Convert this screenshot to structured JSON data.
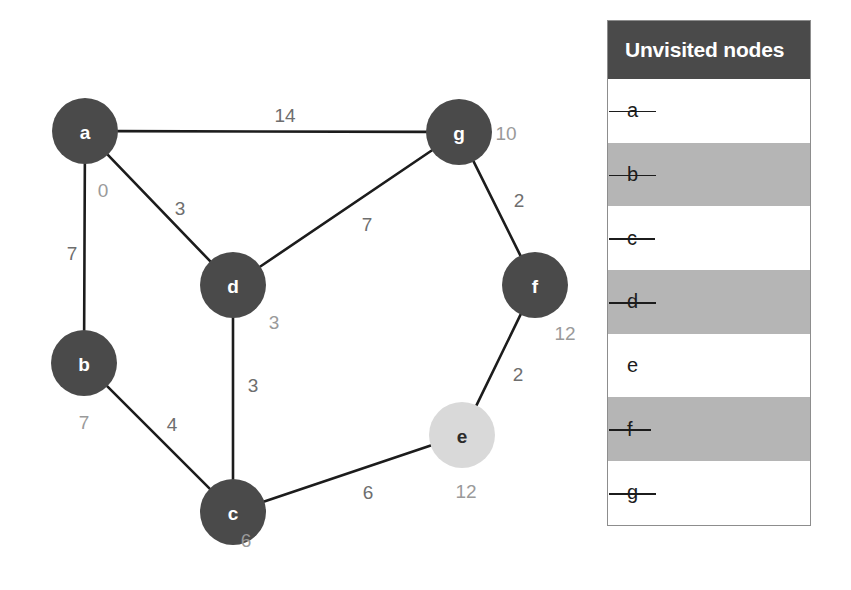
{
  "graph": {
    "nodes": [
      {
        "id": "a",
        "label": "a",
        "dist": "0",
        "cx": 85,
        "cy": 131,
        "r": 33,
        "state": "visited",
        "dist_x": 103,
        "dist_y": 190
      },
      {
        "id": "b",
        "label": "b",
        "dist": "7",
        "cx": 84,
        "cy": 363,
        "r": 33,
        "state": "visited",
        "dist_x": 84,
        "dist_y": 422
      },
      {
        "id": "c",
        "label": "c",
        "dist": "6",
        "cx": 233,
        "cy": 512,
        "r": 33,
        "state": "visited",
        "dist_x": 246,
        "dist_y": 540
      },
      {
        "id": "d",
        "label": "d",
        "dist": "3",
        "cx": 233,
        "cy": 285,
        "r": 33,
        "state": "visited",
        "dist_x": 274,
        "dist_y": 322
      },
      {
        "id": "e",
        "label": "e",
        "dist": "12",
        "cx": 462,
        "cy": 435,
        "r": 33,
        "state": "current",
        "dist_x": 466,
        "dist_y": 491
      },
      {
        "id": "f",
        "label": "f",
        "dist": "12",
        "cx": 535,
        "cy": 285,
        "r": 33,
        "state": "visited",
        "dist_x": 565,
        "dist_y": 333
      },
      {
        "id": "g",
        "label": "g",
        "dist": "10",
        "cx": 459,
        "cy": 132,
        "r": 33,
        "state": "visited",
        "dist_x": 506,
        "dist_y": 133
      }
    ],
    "edges": [
      {
        "from": "a",
        "to": "g",
        "weight": "14",
        "lx": 285,
        "ly": 115
      },
      {
        "from": "a",
        "to": "d",
        "weight": "3",
        "lx": 180,
        "ly": 208
      },
      {
        "from": "a",
        "to": "b",
        "weight": "7",
        "lx": 72,
        "ly": 253
      },
      {
        "from": "d",
        "to": "g",
        "weight": "7",
        "lx": 367,
        "ly": 224
      },
      {
        "from": "g",
        "to": "f",
        "weight": "2",
        "lx": 519,
        "ly": 200
      },
      {
        "from": "d",
        "to": "c",
        "weight": "3",
        "lx": 253,
        "ly": 385
      },
      {
        "from": "b",
        "to": "c",
        "weight": "4",
        "lx": 172,
        "ly": 424
      },
      {
        "from": "f",
        "to": "e",
        "weight": "2",
        "lx": 518,
        "ly": 374
      },
      {
        "from": "c",
        "to": "e",
        "weight": "6",
        "lx": 368,
        "ly": 492
      }
    ]
  },
  "colors": {
    "node_visited": "#4a4a4a",
    "node_current": "#d9d9d9",
    "edge": "#1c1c1c",
    "weight_text": "#6e6e6e",
    "distance_text": "#9a9a9a",
    "panel_header_bg": "#4a4a4a",
    "panel_row_gray": "#b5b5b5",
    "panel_row_white": "#ffffff"
  },
  "unvisited_panel": {
    "title": "Unvisited nodes",
    "rows": [
      {
        "label": "a",
        "struck": true,
        "shade": "white"
      },
      {
        "label": "b",
        "struck": true,
        "shade": "gray"
      },
      {
        "label": "c",
        "struck": true,
        "shade": "white"
      },
      {
        "label": "d",
        "struck": true,
        "shade": "gray"
      },
      {
        "label": "e",
        "struck": false,
        "shade": "white"
      },
      {
        "label": "f",
        "struck": true,
        "shade": "gray"
      },
      {
        "label": "g",
        "struck": true,
        "shade": "white"
      }
    ]
  }
}
